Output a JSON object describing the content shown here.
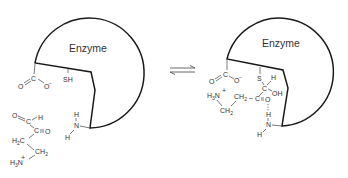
{
  "diagram": {
    "type": "enzyme-substrate equilibrium (thiohemiacetal formation)",
    "left_state": {
      "enzyme_label": "Enzyme",
      "active_site_groups": {
        "carboxylate": {
          "O1": "O",
          "C": "C",
          "O2": "O",
          "charge": "−"
        },
        "thiol": "SH",
        "amine": {
          "H_top": "H",
          "N": "N",
          "H_bottom": "H"
        }
      },
      "substrate": {
        "aldehyde_O": "O",
        "aldehyde_C": "C",
        "aldehyde_H": "H",
        "ketone_C": "C",
        "ketone_O": "O",
        "ch2_a": "H",
        "ch2_a_sub": "2",
        "ch2_a_C": "C",
        "ch2_b": "CH",
        "ch2_b_sub": "2",
        "amine": "H",
        "amine_sub": "3",
        "amine_N": "N",
        "amine_charge": "+"
      }
    },
    "equilibrium_symbol": "⇌",
    "right_state": {
      "enzyme_label": "Enzyme",
      "active_site_groups": {
        "carboxylate": {
          "O1": "O",
          "C": "C",
          "O2": "O",
          "charge": "−"
        },
        "S": "S",
        "H_on_C": "H",
        "C_thio": "C",
        "OH": "OH",
        "amine": {
          "H_top": "H",
          "N": "N",
          "H_bottom": "H"
        }
      },
      "substrate": {
        "h3n": "H",
        "h3n_sub": "3",
        "h3n_N": "N",
        "h3n_charge": "+",
        "ch2_a": "CH",
        "ch2_a_sub": "2",
        "dash": "–",
        "keto_C": "C",
        "keto_O": "O",
        "ch2_b": "CH",
        "ch2_b_sub": "2"
      }
    }
  }
}
